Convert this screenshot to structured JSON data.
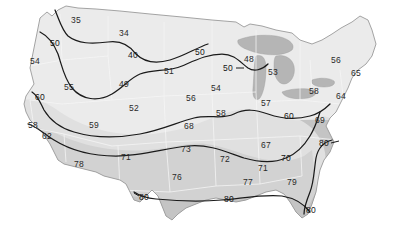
{
  "chart_data": {
    "type": "contour-map",
    "title": "",
    "subtitle": "",
    "xlabel": "",
    "ylabel": "",
    "region": "Continental United States",
    "grid": false,
    "legend_position": "none",
    "contour_interval": 10,
    "contour_levels": [
      40,
      50,
      60,
      70,
      80
    ],
    "contour_labels": [
      {
        "value": "40",
        "x": 133,
        "y": 55
      },
      {
        "value": "50",
        "x": 55,
        "y": 43
      },
      {
        "value": "50",
        "x": 200,
        "y": 52
      },
      {
        "value": "50",
        "x": 228,
        "y": 68
      },
      {
        "value": "60",
        "x": 40,
        "y": 97
      },
      {
        "value": "60",
        "x": 289,
        "y": 116
      },
      {
        "value": "70",
        "x": 286,
        "y": 158
      },
      {
        "value": "80",
        "x": 324,
        "y": 143
      },
      {
        "value": "80",
        "x": 144,
        "y": 197
      },
      {
        "value": "80",
        "x": 229,
        "y": 199
      },
      {
        "value": "80",
        "x": 311,
        "y": 210
      }
    ],
    "station_values": [
      {
        "value": "35",
        "x": 76,
        "y": 20
      },
      {
        "value": "34",
        "x": 124,
        "y": 33
      },
      {
        "value": "54",
        "x": 35,
        "y": 61
      },
      {
        "value": "51",
        "x": 169,
        "y": 71
      },
      {
        "value": "49",
        "x": 124,
        "y": 84
      },
      {
        "value": "48",
        "x": 249,
        "y": 59
      },
      {
        "value": "53",
        "x": 273,
        "y": 72
      },
      {
        "value": "56",
        "x": 336,
        "y": 60
      },
      {
        "value": "65",
        "x": 356,
        "y": 73
      },
      {
        "value": "55",
        "x": 69,
        "y": 87
      },
      {
        "value": "54",
        "x": 216,
        "y": 88
      },
      {
        "value": "58",
        "x": 314,
        "y": 91
      },
      {
        "value": "64",
        "x": 341,
        "y": 96
      },
      {
        "value": "56",
        "x": 191,
        "y": 98
      },
      {
        "value": "52",
        "x": 134,
        "y": 108
      },
      {
        "value": "57",
        "x": 266,
        "y": 103
      },
      {
        "value": "58",
        "x": 221,
        "y": 113
      },
      {
        "value": "58",
        "x": 33,
        "y": 125
      },
      {
        "value": "59",
        "x": 94,
        "y": 125
      },
      {
        "value": "68",
        "x": 189,
        "y": 126
      },
      {
        "value": "69",
        "x": 320,
        "y": 120
      },
      {
        "value": "62",
        "x": 47,
        "y": 136
      },
      {
        "value": "73",
        "x": 186,
        "y": 149
      },
      {
        "value": "67",
        "x": 266,
        "y": 145
      },
      {
        "value": "71",
        "x": 126,
        "y": 157
      },
      {
        "value": "72",
        "x": 225,
        "y": 159
      },
      {
        "value": "78",
        "x": 79,
        "y": 164
      },
      {
        "value": "71",
        "x": 263,
        "y": 168
      },
      {
        "value": "76",
        "x": 177,
        "y": 177
      },
      {
        "value": "77",
        "x": 248,
        "y": 182
      },
      {
        "value": "79",
        "x": 292,
        "y": 182
      }
    ]
  },
  "colors": {
    "background": "#ffffff",
    "land_light": "#ebebeb",
    "land_mid": "#dcdcdc",
    "land_dark": "#c9c9c9",
    "lakes": "#b5b5b5",
    "state_border": "#f4f4f4",
    "coastline": "#9a9a9a",
    "contour_line": "#1a1a1a",
    "label_text": "#2a2a2a"
  }
}
